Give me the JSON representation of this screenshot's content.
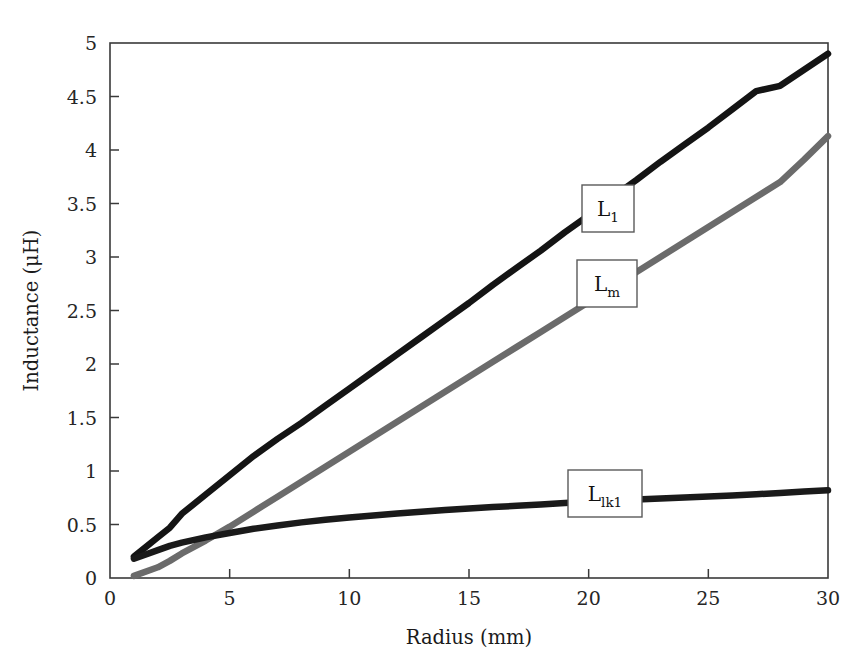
{
  "chart_data": {
    "type": "line",
    "title": "",
    "subtitle": "",
    "xlabel": "Radius (mm)",
    "ylabel": "Inductance (μH)",
    "xlim": [
      0,
      30
    ],
    "ylim": [
      0,
      5
    ],
    "xticks": [
      0,
      5,
      10,
      15,
      20,
      25,
      30
    ],
    "xtick_labels": [
      "0",
      "5",
      "10",
      "15",
      "20",
      "25",
      "30"
    ],
    "yticks": [
      0,
      0.5,
      1,
      1.5,
      2,
      2.5,
      3,
      3.5,
      4,
      4.5,
      5
    ],
    "ytick_labels": [
      "0",
      "0.5",
      "1",
      "1.5",
      "2",
      "2.5",
      "3",
      "3.5",
      "4",
      "4.5",
      "5"
    ],
    "grid": false,
    "legend_position": "inline-callouts",
    "x": [
      1,
      2,
      2.5,
      3,
      4,
      5,
      6,
      7,
      8,
      9,
      10,
      11,
      12,
      13,
      14,
      15,
      16,
      17,
      18,
      19,
      20,
      21,
      22,
      23,
      24,
      25,
      26,
      27,
      28,
      29,
      30
    ],
    "series": [
      {
        "name": "L_1",
        "label_text": "L",
        "label_sub": "1",
        "color": "#141414",
        "width": 6.5,
        "values": [
          0.2,
          0.38,
          0.47,
          0.6,
          0.78,
          0.96,
          1.14,
          1.3,
          1.45,
          1.61,
          1.77,
          1.93,
          2.09,
          2.25,
          2.41,
          2.57,
          2.74,
          2.9,
          3.06,
          3.23,
          3.39,
          3.56,
          3.72,
          3.89,
          4.05,
          4.21,
          4.38,
          4.55,
          4.6,
          4.75,
          4.9
        ]
      },
      {
        "name": "L_m",
        "label_text": "L",
        "label_sub": "m",
        "color": "#6b6b6b",
        "width": 6.5,
        "values": [
          0.02,
          0.1,
          0.16,
          0.23,
          0.35,
          0.48,
          0.62,
          0.76,
          0.9,
          1.04,
          1.18,
          1.32,
          1.46,
          1.6,
          1.74,
          1.88,
          2.02,
          2.16,
          2.3,
          2.44,
          2.58,
          2.72,
          2.86,
          3.0,
          3.14,
          3.28,
          3.42,
          3.56,
          3.7,
          3.91,
          4.13
        ]
      },
      {
        "name": "L_lk1",
        "label_text": "L",
        "label_sub": "lk1",
        "color": "#1a1a1a",
        "width": 6.5,
        "values": [
          0.18,
          0.26,
          0.3,
          0.33,
          0.38,
          0.42,
          0.46,
          0.49,
          0.52,
          0.545,
          0.565,
          0.585,
          0.603,
          0.62,
          0.635,
          0.65,
          0.663,
          0.675,
          0.687,
          0.7,
          0.712,
          0.723,
          0.733,
          0.743,
          0.752,
          0.762,
          0.772,
          0.783,
          0.795,
          0.808,
          0.82
        ]
      }
    ],
    "callouts": [
      {
        "series": "L_1",
        "text": "L",
        "sub": "1",
        "x_px": 582,
        "y_px": 185,
        "w_px": 52,
        "h_px": 47
      },
      {
        "series": "L_m",
        "text": "L",
        "sub": "m",
        "x_px": 577,
        "y_px": 260,
        "w_px": 60,
        "h_px": 47
      },
      {
        "series": "L_lk1",
        "text": "L",
        "sub": "lk1",
        "x_px": 568,
        "y_px": 470,
        "w_px": 74,
        "h_px": 47
      }
    ]
  }
}
